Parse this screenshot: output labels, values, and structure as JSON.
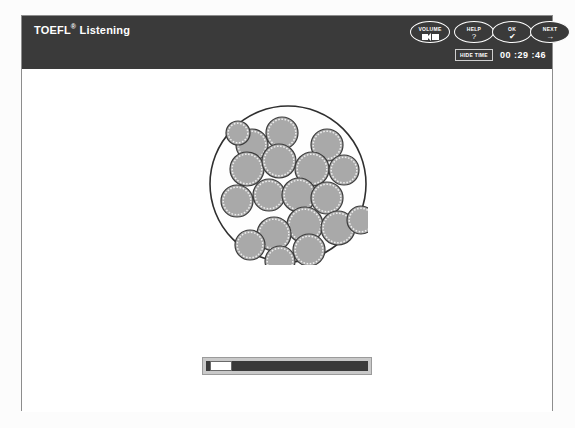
{
  "window": {
    "title_main": "TOEFL",
    "title_reg": "®",
    "title_sub": "Listening"
  },
  "header": {
    "buttons": [
      {
        "id": "volume",
        "label": "VOLUME",
        "icon": "speaker-icon"
      },
      {
        "id": "help",
        "label": "HELP",
        "glyph": "?"
      },
      {
        "id": "ok",
        "label": "OK",
        "glyph": "✔"
      },
      {
        "id": "next",
        "label": "NEXT",
        "glyph": "→"
      }
    ],
    "timer": {
      "hide_label": "HIDE TIME",
      "clock": "00 :29 :46"
    }
  },
  "main": {
    "figure": {
      "name": "petri-dish-cells-diagram",
      "dish": {
        "cx": 80,
        "cy": 81,
        "r": 78,
        "stroke": "#2f2f2f",
        "stroke_width": 1.6,
        "fill": "#fefefe"
      },
      "cell_style": {
        "fill": "#a9a9a9",
        "stroke": "#3c3c3c",
        "stroke_width": 1.2,
        "inner_stroke": "#efefef",
        "inner_dash": "1.6 1.6"
      },
      "cells": [
        {
          "cx": 44,
          "cy": 42,
          "r": 16
        },
        {
          "cx": 74,
          "cy": 30,
          "r": 16
        },
        {
          "cx": 30,
          "cy": 30,
          "r": 12
        },
        {
          "cx": 39,
          "cy": 66,
          "r": 17
        },
        {
          "cx": 71,
          "cy": 58,
          "r": 17
        },
        {
          "cx": 119,
          "cy": 42,
          "r": 16
        },
        {
          "cx": 104,
          "cy": 66,
          "r": 17
        },
        {
          "cx": 136,
          "cy": 67,
          "r": 15
        },
        {
          "cx": 29,
          "cy": 98,
          "r": 16
        },
        {
          "cx": 61,
          "cy": 92,
          "r": 16
        },
        {
          "cx": 91,
          "cy": 92,
          "r": 17
        },
        {
          "cx": 119,
          "cy": 95,
          "r": 16
        },
        {
          "cx": 97,
          "cy": 122,
          "r": 18
        },
        {
          "cx": 130,
          "cy": 125,
          "r": 17
        },
        {
          "cx": 153,
          "cy": 117,
          "r": 14
        },
        {
          "cx": 66,
          "cy": 131,
          "r": 17
        },
        {
          "cx": 101,
          "cy": 147,
          "r": 16
        },
        {
          "cx": 42,
          "cy": 142,
          "r": 15
        },
        {
          "cx": 72,
          "cy": 158,
          "r": 15
        }
      ]
    },
    "audio_progress": {
      "name": "audio-progress-bar",
      "position_percent": 2
    }
  }
}
